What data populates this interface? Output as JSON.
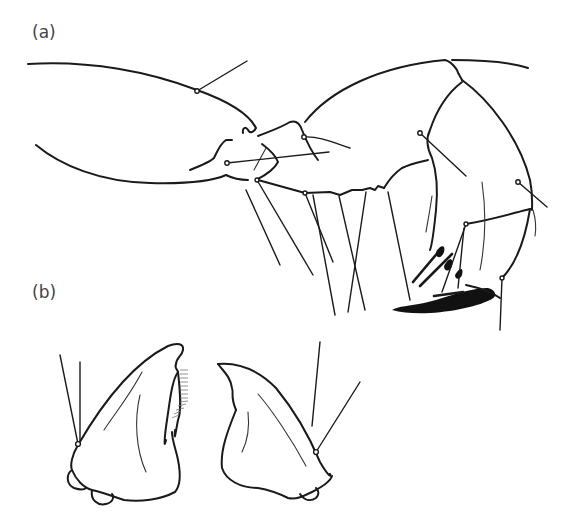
{
  "figure": {
    "panels": [
      {
        "id": "a",
        "label": "(a)"
      },
      {
        "id": "b",
        "label": "(b)"
      }
    ],
    "colors": {
      "line": "#1a1a1a",
      "label": "#444444",
      "background": "#ffffff"
    }
  }
}
